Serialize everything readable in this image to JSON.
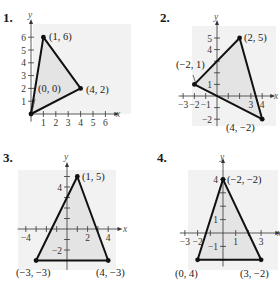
{
  "colors": {
    "panel_bg": "#f2f2f2",
    "triangle_fill": "#e4e4e4",
    "stroke": "#111111",
    "axis": "#333333"
  },
  "chart_data": [
    {
      "type": "scatter",
      "title": "1.",
      "xlabel": "x",
      "ylabel": "y",
      "shape": "triangle",
      "vertices": [
        [
          0,
          0
        ],
        [
          1,
          6
        ],
        [
          4,
          2
        ]
      ],
      "point_labels": [
        "(0, 0)",
        "(1, 6)",
        "(4, 2)"
      ],
      "xticks": [
        1,
        2,
        3,
        4,
        5,
        6
      ],
      "yticks": [
        1,
        2,
        3,
        4,
        5,
        6
      ],
      "xlim": [
        0,
        6.5
      ],
      "ylim": [
        0,
        6.5
      ],
      "layout": {
        "label_pos": [
          3,
          22
        ],
        "origin": [
          31,
          114
        ],
        "ux": 12.4,
        "uy": 12.8,
        "xrange": [
          0,
          6.8
        ],
        "yrange": [
          -0.6,
          7.1
        ],
        "bg": [
          33,
          24,
          98,
          90
        ],
        "ylabel_pos": [
          30,
          18
        ],
        "xlabel_pos": [
          118,
          117
        ],
        "tick_labels_x": [
          [
            1,
            0,
            9
          ],
          [
            2,
            0,
            9
          ],
          [
            3,
            0,
            9
          ],
          [
            4,
            0,
            9
          ],
          [
            5,
            0,
            9
          ],
          [
            6,
            0,
            9
          ]
        ],
        "tick_labels_y": [
          [
            1,
            -6,
            3
          ],
          [
            2,
            -6,
            3
          ],
          [
            3,
            -6,
            3
          ],
          [
            4,
            -6,
            3
          ],
          [
            5,
            -6,
            3
          ],
          [
            6,
            -6,
            3
          ]
        ],
        "xlabel_offset": "below",
        "point_label_pos": [
          [
            38,
            92
          ],
          [
            49,
            40
          ],
          [
            86,
            93
          ]
        ],
        "leader": [
          [
            35,
            99
          ],
          [
            32,
            112
          ]
        ]
      }
    },
    {
      "type": "scatter",
      "title": "2.",
      "xlabel": "x",
      "ylabel": "y",
      "shape": "triangle",
      "vertices": [
        [
          -2,
          1
        ],
        [
          2,
          5
        ],
        [
          4,
          -2
        ]
      ],
      "point_labels": [
        "(−2, 1)",
        "(2, 5)",
        "(4, −2)"
      ],
      "xticks": [
        -3,
        -2,
        -1,
        1,
        2,
        3,
        4
      ],
      "yticks": [
        -2,
        -1,
        1,
        2,
        3,
        4,
        5
      ],
      "xlim": [
        -3.5,
        4.5
      ],
      "ylim": [
        -2.5,
        5.5
      ],
      "layout": {
        "label_pos": [
          160,
          22
        ],
        "origin": [
          217,
          96
        ],
        "ux": 11.3,
        "uy": 11.6,
        "xrange": [
          -3.4,
          4.8
        ],
        "yrange": [
          -2.6,
          6.2
        ],
        "bg": [
          192,
          26,
          84,
          100
        ],
        "ylabel_pos": [
          216,
          20
        ],
        "xlabel_pos": [
          276,
          99
        ],
        "xtick_label_list": [
          [
            -3,
            "−3"
          ],
          [
            -2,
            "−2"
          ],
          [
            -1,
            "−1"
          ],
          [
            3,
            "3"
          ],
          [
            4,
            "4"
          ]
        ],
        "ytick_label_list": [
          [
            -2,
            "−2"
          ],
          [
            1,
            "1"
          ],
          [
            4,
            "4"
          ],
          [
            5,
            "5"
          ]
        ],
        "point_label_pos": [
          [
            176,
            68
          ],
          [
            244,
            41
          ],
          [
            226,
            131
          ]
        ],
        "leader": [
          [
            193,
            75
          ],
          [
            196,
            84
          ]
        ]
      }
    },
    {
      "type": "scatter",
      "title": "3.",
      "xlabel": "x",
      "ylabel": "y",
      "shape": "triangle",
      "vertices": [
        [
          -3,
          -3
        ],
        [
          1,
          5
        ],
        [
          4,
          -3
        ]
      ],
      "point_labels": [
        "(−3, −3)",
        "(1, 5)",
        "(4, −3)"
      ],
      "xticks": [
        -4,
        -3,
        -2,
        -1,
        1,
        2,
        3,
        4
      ],
      "yticks": [
        -3,
        -2,
        -1,
        1,
        2,
        3,
        4,
        5
      ],
      "xlim": [
        -4.5,
        4.5
      ],
      "ylim": [
        -3.5,
        5.5
      ],
      "layout": {
        "label_pos": [
          3,
          162
        ],
        "origin": [
          67,
          229
        ],
        "ux": 10.3,
        "uy": 10.5,
        "xrange": [
          -4.8,
          5.0
        ],
        "yrange": [
          -3.9,
          6.0
        ],
        "bg": [
          18,
          170,
          98,
          100
        ],
        "ylabel_pos": [
          66,
          160
        ],
        "xlabel_pos": [
          125,
          232
        ],
        "xtick_label_list": [
          [
            -4,
            "−4"
          ],
          [
            2,
            "2"
          ],
          [
            4,
            "4"
          ]
        ],
        "ytick_label_list": [
          [
            -2,
            "−2"
          ],
          [
            4,
            "4"
          ]
        ],
        "point_label_pos": [
          [
            16,
            276
          ],
          [
            82,
            180
          ],
          [
            96,
            276
          ]
        ],
        "leader": null
      }
    },
    {
      "type": "scatter",
      "title": "4.",
      "xlabel": "x",
      "ylabel": "y",
      "shape": "triangle",
      "vertices": [
        [
          -2,
          -2
        ],
        [
          0,
          4
        ],
        [
          3,
          -2
        ]
      ],
      "point_labels": [
        "(−2, −2)",
        "(0, 4)",
        "(3, −2)"
      ],
      "xticks": [
        -3,
        -2,
        -1,
        1,
        2,
        3
      ],
      "yticks": [
        -2,
        -1,
        1,
        2,
        3,
        4
      ],
      "xlim": [
        -3.5,
        3.5
      ],
      "ylim": [
        -2.5,
        4.5
      ],
      "layout": {
        "label_pos": [
          157,
          162
        ],
        "origin": [
          223,
          233
        ],
        "ux": 12.7,
        "uy": 13.4,
        "xrange": [
          -3.4,
          4.2
        ],
        "yrange": [
          -2.5,
          5.3
        ],
        "bg": [
          188,
          170,
          90,
          100
        ],
        "ylabel_pos": [
          222,
          160
        ],
        "xlabel_pos": [
          279,
          236
        ],
        "xtick_label_list": [
          [
            -3,
            "−3"
          ],
          [
            -2,
            "−2"
          ],
          [
            1,
            "1"
          ],
          [
            3,
            "3"
          ]
        ],
        "ytick_label_list": [
          [
            -1,
            "−1"
          ],
          [
            1,
            "1"
          ],
          [
            4,
            "4"
          ]
        ],
        "point_label_pos": [
          [
            227,
            183
          ],
          [
            175,
            277
          ],
          [
            240,
            277
          ]
        ],
        "leader": null
      }
    }
  ]
}
